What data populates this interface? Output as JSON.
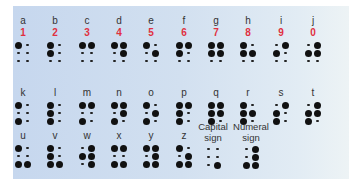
{
  "colors": {
    "panel": "#cddcef",
    "numeral": "#e0303f",
    "text": "#333333",
    "dot": "#111111"
  },
  "rows": [
    {
      "cells": [
        {
          "letter": "a",
          "number": "1",
          "dots": [
            1,
            0,
            0,
            0,
            0,
            0
          ]
        },
        {
          "letter": "b",
          "number": "2",
          "dots": [
            1,
            0,
            1,
            0,
            0,
            0
          ]
        },
        {
          "letter": "c",
          "number": "3",
          "dots": [
            1,
            1,
            0,
            0,
            0,
            0
          ]
        },
        {
          "letter": "d",
          "number": "4",
          "dots": [
            1,
            1,
            0,
            1,
            0,
            0
          ]
        },
        {
          "letter": "e",
          "number": "5",
          "dots": [
            1,
            0,
            0,
            1,
            0,
            0
          ]
        },
        {
          "letter": "f",
          "number": "6",
          "dots": [
            1,
            1,
            1,
            0,
            0,
            0
          ]
        },
        {
          "letter": "g",
          "number": "7",
          "dots": [
            1,
            1,
            1,
            1,
            0,
            0
          ]
        },
        {
          "letter": "h",
          "number": "8",
          "dots": [
            1,
            0,
            1,
            1,
            0,
            0
          ]
        },
        {
          "letter": "i",
          "number": "9",
          "dots": [
            0,
            1,
            1,
            0,
            0,
            0
          ]
        },
        {
          "letter": "j",
          "number": "0",
          "dots": [
            0,
            1,
            1,
            1,
            0,
            0
          ]
        }
      ]
    },
    {
      "cells": [
        {
          "letter": "k",
          "dots": [
            1,
            0,
            0,
            0,
            1,
            0
          ]
        },
        {
          "letter": "l",
          "dots": [
            1,
            0,
            1,
            0,
            1,
            0
          ]
        },
        {
          "letter": "m",
          "dots": [
            1,
            1,
            0,
            0,
            1,
            0
          ]
        },
        {
          "letter": "n",
          "dots": [
            1,
            1,
            0,
            1,
            1,
            0
          ]
        },
        {
          "letter": "o",
          "dots": [
            1,
            0,
            0,
            1,
            1,
            0
          ]
        },
        {
          "letter": "p",
          "dots": [
            1,
            1,
            1,
            0,
            1,
            0
          ]
        },
        {
          "letter": "q",
          "dots": [
            1,
            1,
            1,
            1,
            1,
            0
          ]
        },
        {
          "letter": "r",
          "dots": [
            1,
            0,
            1,
            1,
            1,
            0
          ]
        },
        {
          "letter": "s",
          "dots": [
            0,
            1,
            1,
            0,
            1,
            0
          ]
        },
        {
          "letter": "t",
          "dots": [
            0,
            1,
            1,
            1,
            1,
            0
          ]
        }
      ]
    },
    {
      "cells": [
        {
          "letter": "u",
          "dots": [
            1,
            0,
            0,
            0,
            1,
            1
          ]
        },
        {
          "letter": "v",
          "dots": [
            1,
            0,
            1,
            0,
            1,
            1
          ]
        },
        {
          "letter": "w",
          "dots": [
            0,
            1,
            1,
            1,
            0,
            1
          ]
        },
        {
          "letter": "x",
          "dots": [
            1,
            1,
            0,
            0,
            1,
            1
          ]
        },
        {
          "letter": "y",
          "dots": [
            1,
            1,
            0,
            1,
            1,
            1
          ]
        },
        {
          "letter": "z",
          "dots": [
            1,
            0,
            0,
            1,
            1,
            1
          ]
        },
        {
          "letter": "Capital sign",
          "line1": "Capital",
          "line2": "sign",
          "dots": [
            0,
            0,
            0,
            0,
            0,
            1
          ]
        },
        {
          "letter": "Numeral sign",
          "line1": "Numeral",
          "line2": "sign",
          "dots": [
            0,
            1,
            0,
            1,
            1,
            1
          ]
        }
      ]
    }
  ]
}
